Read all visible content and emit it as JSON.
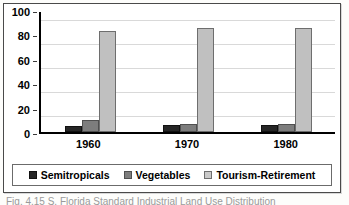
{
  "document": {
    "caption_partial": "Fig. 4.15  S. Florida  Standard  Industrial  Land  Use  Distribution"
  },
  "colors": {
    "series_semitropicals": "#262626",
    "series_vegetables": "#7d7d7d",
    "series_tourism": "#c0c0c0",
    "axis": "#000000",
    "gridline": "#d9d9d9",
    "frame": "#4a4a4a"
  },
  "chart_data": {
    "type": "bar",
    "title": "",
    "xlabel": "",
    "ylabel": "",
    "categories": [
      "1960",
      "1970",
      "1980"
    ],
    "series": [
      {
        "name": "Semitropicals",
        "values": [
          5,
          6,
          5.5
        ]
      },
      {
        "name": "Vegetables",
        "values": [
          10,
          6.5,
          6.5
        ]
      },
      {
        "name": "Tourism-Retirement",
        "values": [
          84,
          87,
          87
        ]
      }
    ],
    "ylim": [
      0,
      100
    ],
    "yticks": [
      0,
      20,
      40,
      60,
      80,
      100
    ],
    "ytick_labels": [
      "0",
      "20",
      "40",
      "60",
      "80",
      "100"
    ],
    "grid": true,
    "grid_axis": "y",
    "legend": true,
    "legend_position": "bottom"
  }
}
